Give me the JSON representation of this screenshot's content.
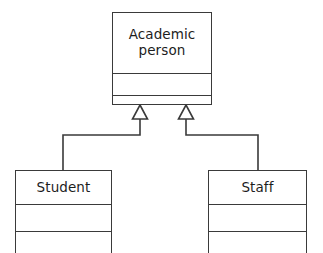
{
  "diagram": {
    "kind": "uml-class-diagram",
    "background_color": "#ffffff",
    "line_color": "#3a3a3a",
    "text_color": "#1d1d1d",
    "classes": [
      {
        "id": "academic-person",
        "name_line1": "Academic",
        "name_line2": "person",
        "attributes": "",
        "operations": ""
      },
      {
        "id": "student",
        "name_line1": "Student",
        "name_line2": "",
        "attributes": "",
        "operations": ""
      },
      {
        "id": "staff",
        "name_line1": "Staff",
        "name_line2": "",
        "attributes": "",
        "operations": ""
      }
    ],
    "relationships": [
      {
        "id": "student-generalizes-academic-person",
        "type": "generalization",
        "from": "Student",
        "to": "Academic person",
        "arrow": "hollow-triangle"
      },
      {
        "id": "staff-generalizes-academic-person",
        "type": "generalization",
        "from": "Staff",
        "to": "Academic person",
        "arrow": "hollow-triangle"
      }
    ]
  }
}
